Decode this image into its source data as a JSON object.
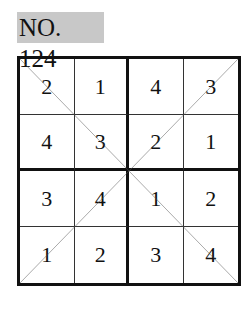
{
  "title": "NO. 124",
  "puzzle": {
    "size": 4,
    "box_size": 2,
    "diagonals": true,
    "rows": [
      [
        "2",
        "1",
        "4",
        "3"
      ],
      [
        "4",
        "3",
        "2",
        "1"
      ],
      [
        "3",
        "4",
        "1",
        "2"
      ],
      [
        "1",
        "2",
        "3",
        "4"
      ]
    ]
  },
  "colors": {
    "title_bg": "#c8c8c8",
    "line": "#111111",
    "diagonal": "#555555"
  }
}
